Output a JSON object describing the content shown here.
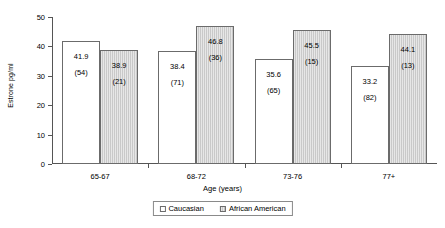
{
  "chart_data": {
    "type": "bar",
    "title": "",
    "xlabel": "Age (years)",
    "ylabel": "Estrone pg/ml",
    "ylim": [
      0,
      50
    ],
    "yticks": [
      0,
      10,
      20,
      30,
      40,
      50
    ],
    "grid": false,
    "legend_position": "bottom",
    "categories": [
      "65-67",
      "68-72",
      "73-76",
      "77+"
    ],
    "series": [
      {
        "name": "Caucasian",
        "color": "#ffffff",
        "values": [
          41.9,
          38.4,
          35.6,
          33.2
        ],
        "counts": [
          54,
          71,
          65,
          82
        ],
        "value_labels": [
          "41.9",
          "38.4",
          "35.6",
          "33.2"
        ],
        "count_labels": [
          "(54)",
          "(71)",
          "(65)",
          "(82)"
        ]
      },
      {
        "name": "African American",
        "color": "#c9c9c9",
        "values": [
          38.9,
          46.8,
          45.5,
          44.1
        ],
        "counts": [
          21,
          36,
          15,
          13
        ],
        "value_labels": [
          "38.9",
          "46.8",
          "45.5",
          "44.1"
        ],
        "count_labels": [
          "(21)",
          "(36)",
          "(15)",
          "(13)"
        ]
      }
    ]
  },
  "axis": {
    "y_tick_labels": [
      "0",
      "10",
      "20",
      "30",
      "40",
      "50"
    ],
    "y_axis_title": "Estrone pg/ml",
    "x_axis_title": "Age (years)",
    "x_tick_labels": [
      "65-67",
      "68-72",
      "73-76",
      "77+"
    ]
  },
  "legend": {
    "items": [
      {
        "label": "Caucasian",
        "swatch": "open-square-icon"
      },
      {
        "label": "African American",
        "swatch": "shaded-square-icon"
      }
    ]
  }
}
